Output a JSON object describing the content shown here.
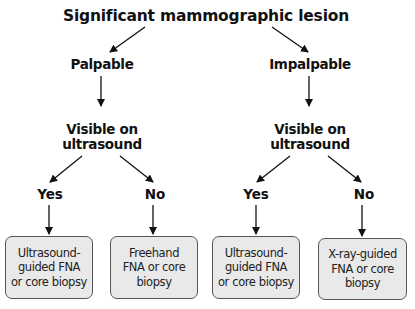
{
  "diagram": {
    "root": "Significant mammographic lesion",
    "branches": [
      {
        "label": "Palpable",
        "question": {
          "line1": "Visible on",
          "line2": "ultrasound"
        },
        "outcomes": [
          {
            "answer": "Yes",
            "action": {
              "line1": "Ultrasound-",
              "line2": "guided FNA",
              "line3": "or core biopsy"
            }
          },
          {
            "answer": "No",
            "action": {
              "line1": "Freehand",
              "line2": "FNA or core",
              "line3": "biopsy"
            }
          }
        ]
      },
      {
        "label": "Impalpable",
        "question": {
          "line1": "Visible on",
          "line2": "ultrasound"
        },
        "outcomes": [
          {
            "answer": "Yes",
            "action": {
              "line1": "Ultrasound-",
              "line2": "guided FNA",
              "line3": "or core biopsy"
            }
          },
          {
            "answer": "No",
            "action": {
              "line1": "X-ray-guided",
              "line2": "FNA or core",
              "line3": "biopsy"
            }
          }
        ]
      }
    ],
    "colors": {
      "box_fill": "#e9e9e9",
      "box_border": "#555555",
      "line": "#111111"
    }
  }
}
